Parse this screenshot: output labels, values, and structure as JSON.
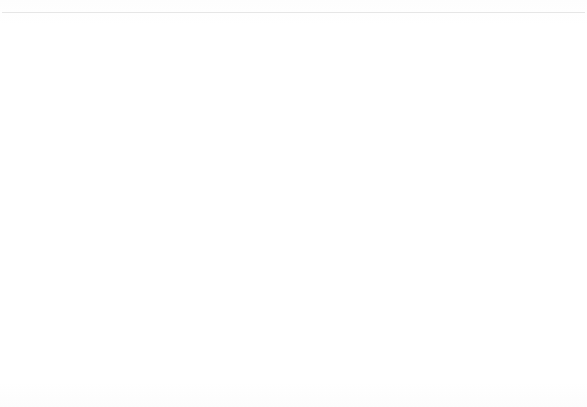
{
  "chart_data": {
    "type": "bar",
    "title": "",
    "subtitle": "",
    "xlabel": "",
    "ylabel": "Percentage",
    "categories": [
      "Christianity",
      "Nonreligious/Secular",
      "Other"
    ],
    "series": [
      {
        "name": "1990",
        "values": [
          82,
          7.5,
          11.8
        ],
        "color": "#ffffff"
      },
      {
        "name": "2001",
        "values": [
          76,
          13.5,
          11.5
        ],
        "color": "#c0c0c0"
      }
    ],
    "ylim": [
      0,
      100
    ],
    "ytick_step": 10,
    "yticks": [
      "100",
      "90",
      "80",
      "70",
      "60",
      "50",
      "40",
      "30",
      "20",
      "10",
      "0"
    ],
    "grid": true,
    "legend_position": "right-outside",
    "legend_entries": [
      "1990",
      "2001"
    ],
    "annotations": []
  },
  "legend": {
    "entries": [
      {
        "label": "1990",
        "swatch": "legend-swatch-1990"
      },
      {
        "label": "2001",
        "swatch": "legend-swatch-2001"
      }
    ]
  }
}
